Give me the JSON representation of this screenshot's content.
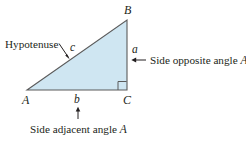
{
  "figure": {
    "type": "right-triangle-labeled-diagram",
    "background_color": "#ffffff",
    "triangle": {
      "fill_color": "#cfe6f2",
      "stroke_color": "#5b5b5b",
      "vertices": [
        {
          "name": "A",
          "label": "A",
          "x": 27,
          "y": 90
        },
        {
          "name": "B",
          "label": "B",
          "x": 127,
          "y": 20
        },
        {
          "name": "C",
          "label": "C",
          "x": 127,
          "y": 90
        }
      ],
      "right_angle_at": "C"
    },
    "side_labels": {
      "hypotenuse": "c",
      "opposite": "a",
      "adjacent": "b"
    },
    "vertex_labels": {
      "top": "B",
      "left": "A",
      "right": "C"
    },
    "callouts": {
      "hypotenuse": "Hypotenuse",
      "opposite": "Side opposite angle A",
      "adjacent": "Side adjacent angle A"
    },
    "callout_text_parts": {
      "opposite_plain": "Side opposite angle ",
      "opposite_italic": "A",
      "adjacent_plain": "Side adjacent angle ",
      "adjacent_italic": "A"
    }
  }
}
